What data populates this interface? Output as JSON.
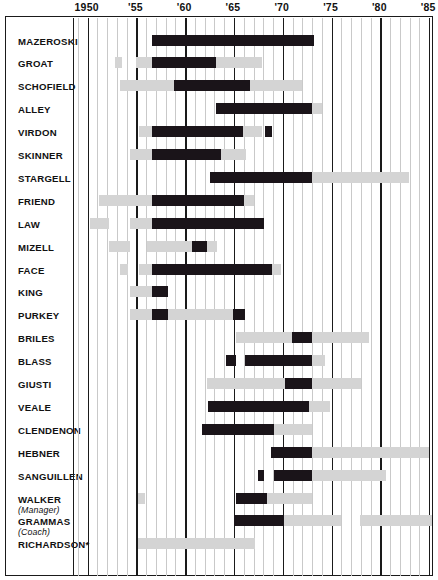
{
  "chart_data": {
    "type": "bar",
    "chart_style": "timeline-gantt",
    "title": "",
    "xlabel": "",
    "ylabel": "",
    "xlim": [
      1948.6,
      1985.4
    ],
    "grid": true,
    "legend": null,
    "axis": {
      "major_ticks": [
        {
          "value": 1950,
          "label": "1950"
        },
        {
          "value": 1955,
          "label": "'55"
        },
        {
          "value": 1960,
          "label": "'60"
        },
        {
          "value": 1965,
          "label": "'65"
        },
        {
          "value": 1970,
          "label": "'70"
        },
        {
          "value": 1975,
          "label": "'75"
        },
        {
          "value": 1980,
          "label": "'80"
        },
        {
          "value": 1985,
          "label": "'85"
        }
      ],
      "minor_tick_step": 1,
      "minor_tick_range": [
        1949,
        1985
      ]
    },
    "colors": {
      "dark": "#1a1419",
      "light": "#d4d4d4",
      "gridline": "#c9c9c9",
      "gridline_major": "#1a1a1a",
      "background": "#ffffff",
      "text": "#111111"
    },
    "categories": [
      "MAZEROSKI",
      "GROAT",
      "SCHOFIELD",
      "ALLEY",
      "VIRDON",
      "SKINNER",
      "STARGELL",
      "FRIEND",
      "LAW",
      "MIZELL",
      "FACE",
      "KING",
      "PURKEY",
      "BRILES",
      "BLASS",
      "GIUSTI",
      "VEALE",
      "CLENDENON",
      "HEBNER",
      "SANGUILLEN",
      "WALKER",
      "GRAMMAS",
      "RICHARDSON*"
    ],
    "rows": [
      {
        "label": "MAZEROSKI",
        "sublabel": "",
        "segments": [
          {
            "shade": "dark",
            "start": 1956.6,
            "end": 1973.2
          }
        ]
      },
      {
        "label": "GROAT",
        "sublabel": "",
        "segments": [
          {
            "shade": "light",
            "start": 1952.8,
            "end": 1953.5
          },
          {
            "shade": "light",
            "start": 1955.0,
            "end": 1967.9
          },
          {
            "shade": "dark",
            "start": 1956.6,
            "end": 1963.2
          }
        ]
      },
      {
        "label": "SCHOFIELD",
        "sublabel": "",
        "segments": [
          {
            "shade": "light",
            "start": 1953.3,
            "end": 1972.0
          },
          {
            "shade": "dark",
            "start": 1958.9,
            "end": 1966.6
          }
        ]
      },
      {
        "label": "ALLEY",
        "sublabel": "",
        "segments": [
          {
            "shade": "light",
            "start": 1963.2,
            "end": 1974.0
          },
          {
            "shade": "dark",
            "start": 1963.2,
            "end": 1973.0
          }
        ]
      },
      {
        "label": "VIRDON",
        "sublabel": "",
        "segments": [
          {
            "shade": "light",
            "start": 1955.3,
            "end": 1967.9
          },
          {
            "shade": "dark",
            "start": 1956.6,
            "end": 1965.9
          },
          {
            "shade": "dark",
            "start": 1968.2,
            "end": 1968.9
          }
        ]
      },
      {
        "label": "SKINNER",
        "sublabel": "",
        "segments": [
          {
            "shade": "light",
            "start": 1954.3,
            "end": 1966.2
          },
          {
            "shade": "dark",
            "start": 1956.6,
            "end": 1963.7
          }
        ]
      },
      {
        "label": "STARGELL",
        "sublabel": "",
        "segments": [
          {
            "shade": "light",
            "start": 1962.5,
            "end": 1982.9
          },
          {
            "shade": "dark",
            "start": 1962.5,
            "end": 1973.0
          }
        ]
      },
      {
        "label": "FRIEND",
        "sublabel": "",
        "segments": [
          {
            "shade": "light",
            "start": 1951.2,
            "end": 1967.1
          },
          {
            "shade": "dark",
            "start": 1956.6,
            "end": 1966.0
          }
        ]
      },
      {
        "label": "LAW",
        "sublabel": "",
        "segments": [
          {
            "shade": "light",
            "start": 1950.2,
            "end": 1952.2
          },
          {
            "shade": "light",
            "start": 1954.3,
            "end": 1956.8
          },
          {
            "shade": "dark",
            "start": 1956.6,
            "end": 1968.1
          }
        ]
      },
      {
        "label": "MIZELL",
        "sublabel": "",
        "segments": [
          {
            "shade": "light",
            "start": 1952.2,
            "end": 1954.3
          },
          {
            "shade": "light",
            "start": 1956.1,
            "end": 1963.3
          },
          {
            "shade": "dark",
            "start": 1960.7,
            "end": 1962.2
          }
        ]
      },
      {
        "label": "FACE",
        "sublabel": "",
        "segments": [
          {
            "shade": "light",
            "start": 1953.3,
            "end": 1954.1
          },
          {
            "shade": "light",
            "start": 1955.3,
            "end": 1956.8
          },
          {
            "shade": "dark",
            "start": 1956.6,
            "end": 1968.9
          },
          {
            "shade": "light",
            "start": 1968.9,
            "end": 1969.8
          }
        ]
      },
      {
        "label": "KING",
        "sublabel": "",
        "segments": [
          {
            "shade": "light",
            "start": 1954.3,
            "end": 1956.8
          },
          {
            "shade": "dark",
            "start": 1956.6,
            "end": 1958.2
          }
        ]
      },
      {
        "label": "PURKEY",
        "sublabel": "",
        "segments": [
          {
            "shade": "light",
            "start": 1954.3,
            "end": 1965.2
          },
          {
            "shade": "dark",
            "start": 1956.6,
            "end": 1958.2
          },
          {
            "shade": "dark",
            "start": 1964.9,
            "end": 1966.1
          }
        ]
      },
      {
        "label": "BRILES",
        "sublabel": "",
        "segments": [
          {
            "shade": "light",
            "start": 1965.2,
            "end": 1978.8
          },
          {
            "shade": "dark",
            "start": 1970.9,
            "end": 1973.0
          }
        ]
      },
      {
        "label": "BLASS",
        "sublabel": "",
        "segments": [
          {
            "shade": "dark",
            "start": 1964.2,
            "end": 1965.2
          },
          {
            "shade": "light",
            "start": 1966.1,
            "end": 1974.3
          },
          {
            "shade": "dark",
            "start": 1966.1,
            "end": 1973.0
          }
        ]
      },
      {
        "label": "GIUSTI",
        "sublabel": "",
        "segments": [
          {
            "shade": "light",
            "start": 1962.2,
            "end": 1978.0
          },
          {
            "shade": "dark",
            "start": 1970.2,
            "end": 1973.0
          }
        ]
      },
      {
        "label": "VEALE",
        "sublabel": "",
        "segments": [
          {
            "shade": "light",
            "start": 1962.3,
            "end": 1974.8
          },
          {
            "shade": "dark",
            "start": 1962.3,
            "end": 1972.7
          }
        ]
      },
      {
        "label": "CLENDENON",
        "sublabel": "",
        "segments": [
          {
            "shade": "light",
            "start": 1961.7,
            "end": 1973.0
          },
          {
            "shade": "dark",
            "start": 1961.7,
            "end": 1969.1
          }
        ]
      },
      {
        "label": "HEBNER",
        "sublabel": "",
        "segments": [
          {
            "shade": "light",
            "start": 1968.8,
            "end": 1985.0
          },
          {
            "shade": "dark",
            "start": 1968.8,
            "end": 1973.0
          }
        ]
      },
      {
        "label": "SANGUILLEN",
        "sublabel": "",
        "segments": [
          {
            "shade": "dark",
            "start": 1967.5,
            "end": 1968.1
          },
          {
            "shade": "light",
            "start": 1969.1,
            "end": 1980.6
          },
          {
            "shade": "dark",
            "start": 1969.1,
            "end": 1973.0
          }
        ]
      },
      {
        "label": "WALKER",
        "sublabel": "(Manager)",
        "segments": [
          {
            "shade": "light",
            "start": 1955.2,
            "end": 1955.9
          },
          {
            "shade": "light",
            "start": 1965.2,
            "end": 1973.0
          },
          {
            "shade": "dark",
            "start": 1965.2,
            "end": 1968.4
          }
        ]
      },
      {
        "label": "GRAMMAS",
        "sublabel": "(Coach)",
        "segments": [
          {
            "shade": "dark",
            "start": 1965.0,
            "end": 1970.1
          },
          {
            "shade": "light",
            "start": 1970.1,
            "end": 1976.0
          },
          {
            "shade": "light",
            "start": 1977.9,
            "end": 1985.4
          }
        ]
      },
      {
        "label": "RICHARDSON*",
        "sublabel": "",
        "segments": [
          {
            "shade": "light",
            "start": 1955.2,
            "end": 1967.2
          }
        ]
      }
    ]
  }
}
